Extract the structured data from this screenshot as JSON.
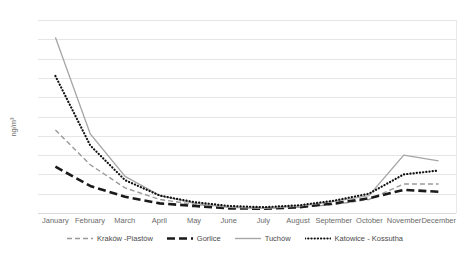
{
  "chart_data": {
    "type": "line",
    "title": "",
    "xlabel": "",
    "ylabel": "ng/m³",
    "ylim": [
      0,
      50
    ],
    "yticks": [
      0,
      5,
      10,
      15,
      20,
      25,
      30,
      35,
      40,
      45,
      50
    ],
    "grid": true,
    "legend_position": "bottom",
    "categories": [
      "January",
      "February",
      "March",
      "April",
      "May",
      "June",
      "July",
      "August",
      "September",
      "October",
      "November",
      "December"
    ],
    "series": [
      {
        "name": "Kraków -Piastów",
        "style": "dashed",
        "color": "#9a9a9a",
        "values": [
          21.5,
          12.5,
          6.5,
          3.5,
          2.2,
          1.5,
          1.2,
          1.5,
          2.2,
          3.5,
          7.5,
          7.5
        ]
      },
      {
        "name": "Gorlice",
        "style": "long-dashed-thick",
        "color": "#1a1a1a",
        "values": [
          12.0,
          7.0,
          4.2,
          2.5,
          1.8,
          1.2,
          1.1,
          1.5,
          2.5,
          3.8,
          6.0,
          5.5
        ]
      },
      {
        "name": "Tuchów",
        "style": "solid",
        "color": "#a6a6a6",
        "values": [
          45.5,
          20.5,
          9.5,
          4.5,
          2.5,
          1.5,
          1.2,
          1.8,
          3.0,
          4.5,
          15.0,
          13.5
        ]
      },
      {
        "name": "Katowice - Kossutha",
        "style": "dotted",
        "color": "#111111",
        "values": [
          35.5,
          17.5,
          8.5,
          4.5,
          2.8,
          1.8,
          1.5,
          2.0,
          3.2,
          5.0,
          10.0,
          11.0
        ]
      }
    ]
  },
  "legend": {
    "items": [
      {
        "label": "Kraków -Piastów"
      },
      {
        "label": "Gorlice"
      },
      {
        "label": "Tuchów"
      },
      {
        "label": "Katowice - Kossutha"
      }
    ]
  }
}
